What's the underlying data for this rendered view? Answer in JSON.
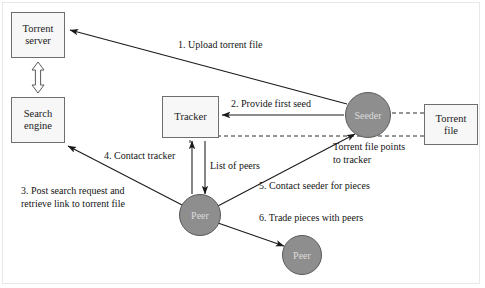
{
  "diagram": {
    "colors": {
      "box_fill": "#f7f7f7",
      "box_stroke": "#6e6e6e",
      "circle_fill": "#8e8e8e",
      "circle_stroke": "#5a5a5a",
      "circle_text": "#dcdcdc",
      "arrow": "#1a1a1a",
      "text": "#141414",
      "frame": "#e8e8e8",
      "background": "#ffffff"
    },
    "nodes": [
      {
        "id": "torrent-server",
        "label": "Torrent\nserver",
        "shape": "box",
        "x": 11,
        "y": 12,
        "w": 54,
        "h": 46
      },
      {
        "id": "search-engine",
        "label": "Search\nengine",
        "shape": "box",
        "x": 11,
        "y": 97,
        "w": 54,
        "h": 46
      },
      {
        "id": "tracker",
        "label": "Tracker",
        "shape": "box",
        "x": 162,
        "y": 96,
        "w": 57,
        "h": 42
      },
      {
        "id": "torrent-file",
        "label": "Torrent\nfile",
        "shape": "box",
        "x": 424,
        "y": 104,
        "w": 54,
        "h": 41
      },
      {
        "id": "seeder",
        "label": "Seeder",
        "shape": "circle",
        "cx": 368,
        "cy": 115,
        "r": 23
      },
      {
        "id": "peer-1",
        "label": "Peer",
        "shape": "circle",
        "cx": 200,
        "cy": 215,
        "r": 21
      },
      {
        "id": "peer-2",
        "label": "Peer",
        "shape": "circle",
        "cx": 302,
        "cy": 255,
        "r": 20
      }
    ],
    "labels": [
      {
        "id": "step-1",
        "text": "1. Upload torrent file",
        "x": 178,
        "y": 39,
        "align": "left"
      },
      {
        "id": "step-2",
        "text": "2. Provide first seed",
        "x": 231,
        "y": 98,
        "align": "left"
      },
      {
        "id": "step-3",
        "text": "3. Post search request and\nretrieve link to torrent file",
        "x": 21,
        "y": 185,
        "align": "left"
      },
      {
        "id": "step-4",
        "text": "4. Contact tracker",
        "x": 104,
        "y": 150,
        "align": "left"
      },
      {
        "id": "step-5",
        "text": "5. Contact seeder for pieces",
        "x": 259,
        "y": 180,
        "align": "left"
      },
      {
        "id": "step-6",
        "text": "6. Trade pieces with peers",
        "x": 259,
        "y": 212,
        "align": "left"
      },
      {
        "id": "list-of-peers",
        "text": "List of peers",
        "x": 210,
        "y": 160,
        "align": "left"
      },
      {
        "id": "torrent-file-points",
        "text": "Torrent file points\nto tracker",
        "x": 333,
        "y": 141,
        "align": "left"
      }
    ],
    "edges": [
      {
        "id": "seeder-to-server",
        "from": "seeder",
        "to": "torrent-server",
        "style": "solid",
        "arrow": "end"
      },
      {
        "id": "server-search-link",
        "from": "torrent-server",
        "to": "search-engine",
        "style": "hollow",
        "arrow": "both"
      },
      {
        "id": "seeder-to-tracker",
        "from": "seeder",
        "to": "tracker",
        "style": "solid",
        "arrow": "end"
      },
      {
        "id": "torrentfile-tracker",
        "from": "torrent-file",
        "to": "tracker",
        "style": "dashed",
        "arrow": "none"
      },
      {
        "id": "torrentfile-seeder",
        "from": "torrent-file",
        "to": "seeder",
        "style": "dashed",
        "arrow": "none"
      },
      {
        "id": "peer-to-search",
        "from": "peer-1",
        "to": "search-engine",
        "style": "solid",
        "arrow": "end"
      },
      {
        "id": "peer-to-tracker",
        "from": "peer-1",
        "to": "tracker",
        "style": "solid",
        "arrow": "end"
      },
      {
        "id": "tracker-to-peer",
        "from": "tracker",
        "to": "peer-1",
        "style": "solid",
        "arrow": "end"
      },
      {
        "id": "peer-to-seeder",
        "from": "peer-1",
        "to": "seeder",
        "style": "solid",
        "arrow": "both"
      },
      {
        "id": "peer-to-peer",
        "from": "peer-1",
        "to": "peer-2",
        "style": "solid",
        "arrow": "both"
      }
    ]
  }
}
